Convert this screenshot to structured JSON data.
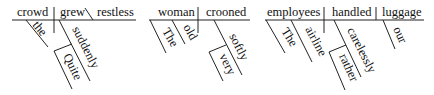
{
  "diagrams": [
    {
      "subject": "crowd",
      "verb": "grew",
      "complement": "restless",
      "modifiers": {
        "subject": [
          "the"
        ],
        "verb": [
          "suddenly"
        ],
        "adverb_modifier": "Quite"
      }
    },
    {
      "subject": "woman",
      "verb": "crooned",
      "modifiers": {
        "subject": [
          "The",
          "old"
        ],
        "verb": [
          "softly"
        ],
        "adverb_modifier": "very"
      }
    },
    {
      "subject": "employees",
      "verb": "handled",
      "object": "luggage",
      "modifiers": {
        "subject": [
          "The",
          "airline"
        ],
        "verb": [
          "carelessly"
        ],
        "adverb_modifier": "rather",
        "object": [
          "our"
        ]
      }
    }
  ]
}
